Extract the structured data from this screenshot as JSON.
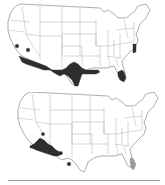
{
  "figure": {
    "panels": [
      {
        "id": "top",
        "subject": "United States map with species range (dark shading)",
        "shaded_regions": [
          "southern California coast",
          "Arizona/Sonora border",
          "south Texas",
          "Gulf coast Louisiana",
          "south Florida",
          "North Carolina coast",
          "two small points in California"
        ],
        "range_color": "#2e2e2e"
      },
      {
        "id": "bottom",
        "subject": "United States map with species range (dark and light shading)",
        "shaded_regions": [
          "southern California / Baja border",
          "small points in Arizona and New Mexico",
          "south Florida (light)"
        ],
        "range_color": "#2e2e2e",
        "light_range_color": "#9c9c9c"
      }
    ],
    "divider_color": "#9a9a9a"
  }
}
